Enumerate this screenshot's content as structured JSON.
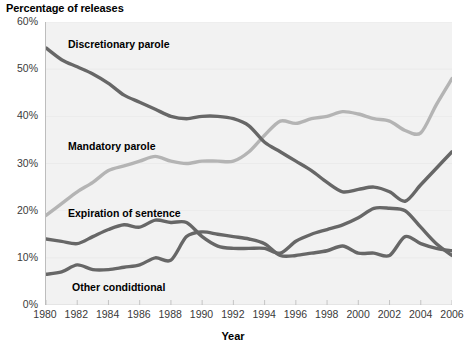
{
  "title": "Percentage of releases",
  "axis": {
    "x_title": "Year",
    "y_ticks": [
      "60%",
      "50%",
      "40%",
      "30%",
      "20%",
      "10%",
      "0%"
    ],
    "x_ticks": [
      "1980",
      "1982",
      "1984",
      "1986",
      "1988",
      "1990",
      "1992",
      "1994",
      "1996",
      "1998",
      "2000",
      "2002",
      "2004",
      "2006"
    ]
  },
  "labels": {
    "discretionary": "Discretionary parole",
    "mandatory": "Mandatory parole",
    "expiration": "Expiration of sentence",
    "other": "Other condidtional"
  },
  "colors": {
    "dark_line": "#676767",
    "light_line": "#b4b4b4",
    "plot_bg": "#f2f2f2",
    "grid": "#d8d8d8",
    "text": "#000000"
  },
  "chart_data": {
    "type": "line",
    "title": "Percentage of releases",
    "xlabel": "Year",
    "ylabel": "Percentage of releases",
    "xlim": [
      1980,
      2006
    ],
    "ylim": [
      0,
      60
    ],
    "grid": false,
    "legend": "inline-labels",
    "x": [
      1980,
      1981,
      1982,
      1983,
      1984,
      1985,
      1986,
      1987,
      1988,
      1989,
      1990,
      1991,
      1992,
      1993,
      1994,
      1995,
      1996,
      1997,
      1998,
      1999,
      2000,
      2001,
      2002,
      2003,
      2004,
      2005,
      2006
    ],
    "series": [
      {
        "name": "Discretionary parole",
        "color": "#676767",
        "values": [
          54.5,
          52.0,
          50.5,
          49.0,
          47.0,
          44.5,
          43.0,
          41.5,
          40.0,
          39.5,
          40.0,
          40.0,
          39.5,
          38.0,
          34.5,
          32.5,
          30.5,
          28.5,
          26.0,
          24.0,
          24.5,
          25.0,
          24.0,
          22.0,
          25.5,
          29.0,
          32.5
        ]
      },
      {
        "name": "Mandatory parole",
        "color": "#b4b4b4",
        "values": [
          19.0,
          21.5,
          24.0,
          26.0,
          28.5,
          29.5,
          30.5,
          31.5,
          30.5,
          30.0,
          30.5,
          30.5,
          30.5,
          32.5,
          36.0,
          39.0,
          38.5,
          39.5,
          40.0,
          41.0,
          40.5,
          39.5,
          39.0,
          37.0,
          36.5,
          42.5,
          48.0
        ]
      },
      {
        "name": "Expiration of sentence",
        "color": "#676767",
        "values": [
          14.0,
          13.5,
          13.0,
          14.5,
          16.0,
          17.0,
          16.5,
          18.0,
          17.5,
          17.5,
          14.5,
          12.5,
          12.0,
          12.0,
          12.0,
          11.0,
          13.5,
          15.0,
          16.0,
          17.0,
          18.5,
          20.5,
          20.5,
          20.0,
          16.5,
          13.0,
          10.5
        ]
      },
      {
        "name": "Other condidtional",
        "color": "#676767",
        "values": [
          6.5,
          7.0,
          8.5,
          7.5,
          7.5,
          8.0,
          8.5,
          10.0,
          9.5,
          14.5,
          15.5,
          15.0,
          14.5,
          14.0,
          13.0,
          10.5,
          10.5,
          11.0,
          11.5,
          12.5,
          11.0,
          11.0,
          10.5,
          14.5,
          13.0,
          12.0,
          11.5
        ]
      }
    ]
  }
}
